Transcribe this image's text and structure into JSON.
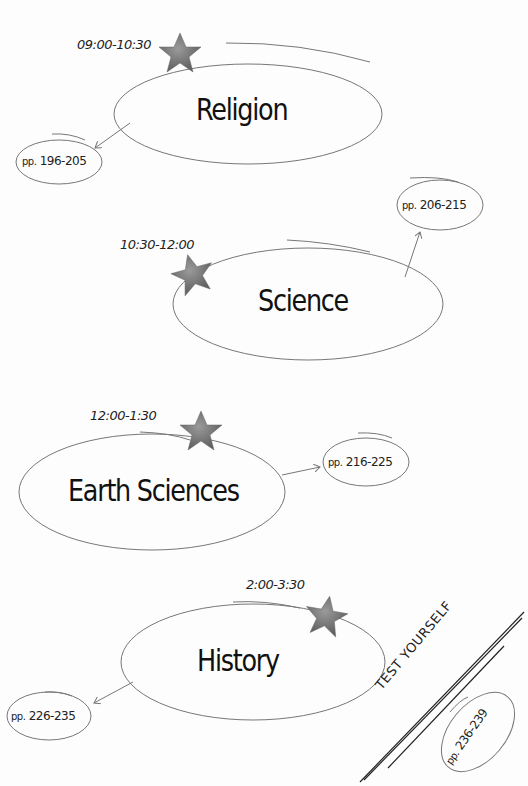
{
  "sessions": [
    {
      "time": "09:00-10:30",
      "subject": "Religion",
      "pages_prefix": "pp.",
      "pages": "196-205"
    },
    {
      "time": "10:30-12:00",
      "subject": "Science",
      "pages_prefix": "pp.",
      "pages": "206-215"
    },
    {
      "time": "12:00-1:30",
      "subject": "Earth Sciences",
      "pages_prefix": "pp.",
      "pages": "216-225"
    },
    {
      "time": "2:00-3:30",
      "subject": "History",
      "pages_prefix": "pp.",
      "pages": "226-235"
    }
  ],
  "test": {
    "label": "TEST YOURSELF",
    "pages_prefix": "pp.",
    "pages": "236-239"
  },
  "colors": {
    "ink": "#1a1a1a",
    "line": "#777777",
    "star": "#6f6f6f",
    "background": "#fdfdfd"
  }
}
